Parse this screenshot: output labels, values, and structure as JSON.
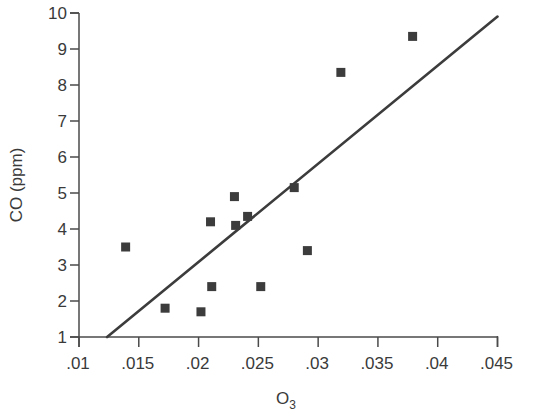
{
  "chart_data": {
    "type": "scatter",
    "title": "",
    "xlabel": "O3",
    "xlabel_main": "O",
    "xlabel_subscript": "3",
    "ylabel": "CO (ppm)",
    "xlim": [
      0.01,
      0.045
    ],
    "ylim": [
      1,
      10
    ],
    "grid": false,
    "legend": null,
    "x_ticks": [
      0.01,
      0.015,
      0.02,
      0.025,
      0.03,
      0.035,
      0.04,
      0.045
    ],
    "x_tick_labels": [
      ".01",
      ".015",
      ".02",
      ".025",
      ".03",
      ".035",
      ".04",
      ".045"
    ],
    "y_ticks": [
      1,
      2,
      3,
      4,
      5,
      6,
      7,
      8,
      9,
      10
    ],
    "y_tick_labels": [
      "1",
      "2",
      "3",
      "4",
      "5",
      "6",
      "7",
      "8",
      "9",
      "10"
    ],
    "series": [
      {
        "name": "observations",
        "marker": "square",
        "color": "#3c3c3c",
        "points": [
          {
            "x": 0.0139,
            "y": 3.5
          },
          {
            "x": 0.0172,
            "y": 1.8
          },
          {
            "x": 0.0202,
            "y": 1.7
          },
          {
            "x": 0.021,
            "y": 4.2
          },
          {
            "x": 0.0211,
            "y": 2.4
          },
          {
            "x": 0.023,
            "y": 4.9
          },
          {
            "x": 0.0231,
            "y": 4.1
          },
          {
            "x": 0.0241,
            "y": 4.35
          },
          {
            "x": 0.0252,
            "y": 2.4
          },
          {
            "x": 0.028,
            "y": 5.15
          },
          {
            "x": 0.0291,
            "y": 3.4
          },
          {
            "x": 0.0319,
            "y": 8.35
          },
          {
            "x": 0.0379,
            "y": 9.35
          }
        ]
      }
    ],
    "regression_line": {
      "name": "fit",
      "color": "#3c3c3c",
      "from": {
        "x": 0.01235,
        "y": 1.0
      },
      "to": {
        "x": 0.045,
        "y": 9.9
      }
    }
  },
  "colors": {
    "axis": "#4a4a4a",
    "text": "#3a3a3a",
    "marker": "#3c3c3c",
    "line": "#3c3c3c"
  }
}
